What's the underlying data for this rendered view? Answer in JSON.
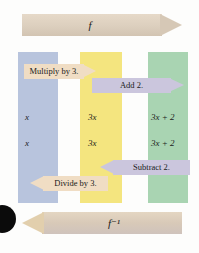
{
  "diagram": {
    "columns": [
      {
        "name": "input-column",
        "color": "#b8c4dd"
      },
      {
        "name": "middle-column",
        "color": "#f4e57f"
      },
      {
        "name": "output-column",
        "color": "#a9d4b2"
      }
    ],
    "forward_arrow": {
      "label": "f",
      "direction": "right",
      "color": "#d6c8b6"
    },
    "inverse_arrow": {
      "label": "f⁻¹",
      "direction": "left",
      "color": "#e2cfad"
    },
    "operations": [
      {
        "label": "Multiply by 3.",
        "direction": "right",
        "color": "#f0ddc4"
      },
      {
        "label": "Add 2.",
        "direction": "right",
        "color": "#cbc6dd"
      },
      {
        "label": "Subtract 2.",
        "direction": "left",
        "color": "#cbc6dd"
      },
      {
        "label": "Divide by 3.",
        "direction": "left",
        "color": "#f0ddc4"
      }
    ],
    "rows": [
      {
        "name": "forward-row",
        "input": "x",
        "middle": "3x",
        "output": "3x + 2"
      },
      {
        "name": "inverse-row",
        "input": "x",
        "middle": "3x",
        "output": "3x + 2"
      }
    ]
  }
}
